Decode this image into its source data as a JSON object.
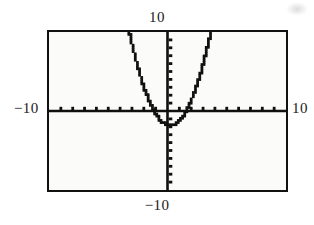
{
  "graph": {
    "title": "",
    "labels": {
      "top": "10",
      "bottom": "−10",
      "left": "−10",
      "right": "10"
    },
    "frame": {
      "border_color": "#111111",
      "background_color": "#fbfbfa",
      "page_background": "#ffffff"
    },
    "axis_color": "#101010",
    "curve_color": "#101010"
  },
  "chart_data": {
    "type": "line",
    "title": "",
    "xlabel": "",
    "ylabel": "",
    "xlim": [
      -10,
      10
    ],
    "ylim": [
      -10,
      10
    ],
    "grid": false,
    "legend": "none",
    "xticks": [
      -9,
      -8,
      -7,
      -6,
      -5,
      -4,
      -3,
      -2,
      -1,
      1,
      2,
      3,
      4,
      5,
      6,
      7,
      8,
      9
    ],
    "yticks": [
      -9,
      -8,
      -7,
      -6,
      -5,
      -4,
      -3,
      -2,
      -1,
      1,
      2,
      3,
      4,
      5,
      6,
      7,
      8,
      9
    ],
    "xtick_labels": [
      "-10",
      "10"
    ],
    "ytick_labels": [
      "-10",
      "10"
    ],
    "axes_style": "centered-crosshair-with-tickmarks",
    "rendering": "pixelated-stairstep-calculator-trace",
    "series": [
      {
        "name": "parabola",
        "equation": "y = x^2 - 2",
        "vertex": [
          0.2,
          -1.8
        ],
        "opens": "upward",
        "x": [
          -3.5,
          -3.0,
          -2.5,
          -2.0,
          -1.5,
          -1.0,
          -0.5,
          0.0,
          0.2,
          0.5,
          1.0,
          1.5,
          2.0,
          2.5,
          3.0,
          3.5
        ],
        "y": [
          12.3,
          9.0,
          6.3,
          4.0,
          2.3,
          1.0,
          0.3,
          0.0,
          -1.8,
          -0.2,
          0.9,
          2.3,
          4.0,
          6.2,
          9.0,
          12.2
        ],
        "x_intercepts": [
          -1.2,
          1.6
        ],
        "y_intercept": -1.7
      }
    ]
  }
}
